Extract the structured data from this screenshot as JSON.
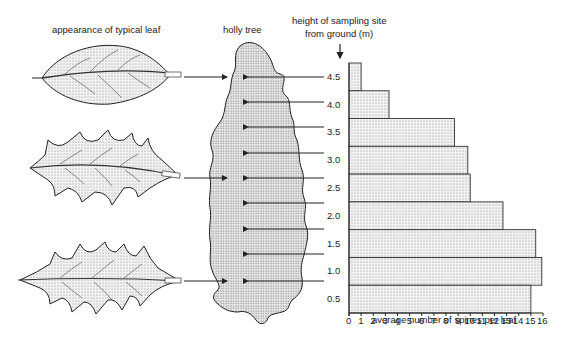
{
  "labels": {
    "leaf_heading": "appearance of typical leaf",
    "tree_heading": "holly tree",
    "height_heading_line1": "height of sampling site",
    "height_heading_line2": "from ground (m)",
    "x_axis_label": "average number of spines per leaf"
  },
  "chart_data": {
    "type": "bar",
    "orientation": "horizontal",
    "title": "",
    "xlabel": "average number of spines per leaf",
    "ylabel": "height of sampling site from ground (m)",
    "categories": [
      "4.5",
      "4.0",
      "3.5",
      "3.0",
      "2.5",
      "2.0",
      "1.5",
      "1.0",
      "0.5"
    ],
    "values": [
      1.0,
      3.3,
      8.7,
      9.8,
      10.0,
      12.7,
      15.4,
      15.9,
      15.0
    ],
    "xlim": [
      0,
      16
    ],
    "xticks": [
      "0",
      "1",
      "2",
      "3",
      "4",
      "5",
      "6",
      "7",
      "8",
      "9",
      "10",
      "11",
      "12",
      "13",
      "14",
      "15",
      "16"
    ],
    "grid": false,
    "legend": null
  },
  "leaves": [
    {
      "name": "smooth-leaf",
      "height": "4.5"
    },
    {
      "name": "spiny-leaf-mid",
      "height": "2.5"
    },
    {
      "name": "spiny-leaf-low",
      "height": "0.5"
    }
  ]
}
